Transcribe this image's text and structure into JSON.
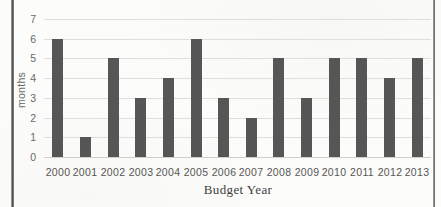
{
  "figure": {
    "kind": "scanned-document-figure",
    "frame_border_color": "#4a4a48",
    "background_color": "#fcfcfa"
  },
  "chart_data": {
    "type": "bar",
    "categories": [
      "2000",
      "2001",
      "2002",
      "2003",
      "2004",
      "2005",
      "2006",
      "2007",
      "2008",
      "2009",
      "2010",
      "2011",
      "2012",
      "2013"
    ],
    "values": [
      6,
      1,
      5,
      3,
      4,
      6,
      3,
      2,
      5,
      3,
      5,
      5,
      4,
      5
    ],
    "title": "",
    "xlabel": "Budget Year",
    "ylabel": "months",
    "ylim": [
      0,
      7
    ],
    "yticks": [
      0,
      1,
      2,
      3,
      4,
      5,
      6,
      7
    ],
    "grid": true,
    "legend": false,
    "bar_color": "#565656",
    "gridline_color": "#dededa",
    "baseline_color": "#cfcfca",
    "tick_text_color": "#6a6a68",
    "xlabel_color": "#3e3e3c"
  }
}
